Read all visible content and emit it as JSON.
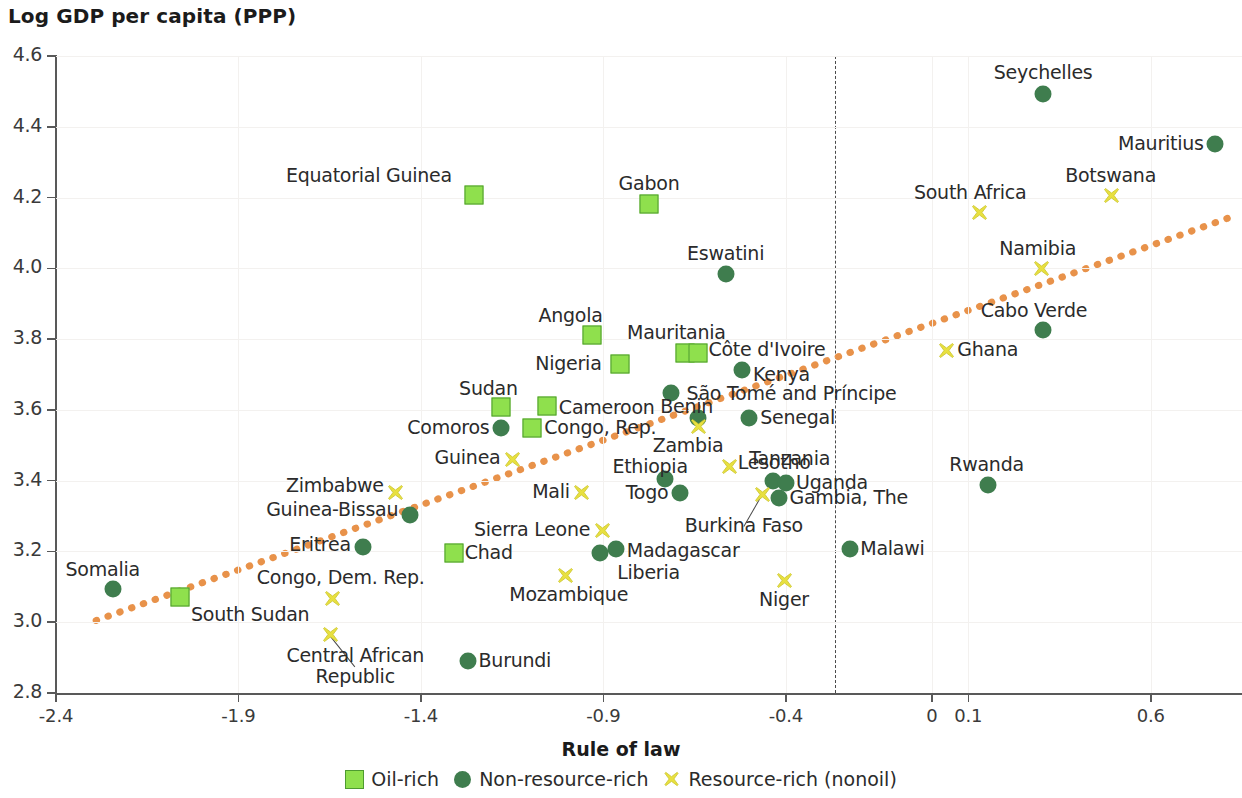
{
  "chart_data": {
    "type": "scatter",
    "title": "Log GDP per capita (PPP)",
    "ylabel": "Log GDP per capita (PPP)",
    "xlabel": "Rule of law",
    "xlim": [
      -2.4,
      0.85
    ],
    "ylim": [
      2.8,
      4.6
    ],
    "xticks": [
      "-2.4",
      "-1.9",
      "-1.4",
      "-0.9",
      "-0.4",
      "0",
      "0.1",
      "0.6"
    ],
    "xtick_values": [
      -2.4,
      -1.9,
      -1.4,
      -0.9,
      -0.4,
      0,
      0.1,
      0.6
    ],
    "yticks": [
      "4.6",
      "4.4",
      "4.2",
      "4.0",
      "3.8",
      "3.6",
      "3.4",
      "3.2",
      "3.0",
      "2.8"
    ],
    "ytick_values": [
      4.6,
      4.4,
      4.2,
      4.0,
      3.8,
      3.6,
      3.4,
      3.2,
      3.0,
      2.8
    ],
    "grid": true,
    "legend_position": "bottom",
    "reference_line": {
      "type": "vertical",
      "x": 0,
      "style": "dashed"
    },
    "trendline": {
      "style": "dotted",
      "color": "#e8924a",
      "x0": -2.29,
      "y0": 3.005,
      "x1": 0.82,
      "y1": 4.145
    },
    "colors": {
      "oil_rich": "#8FE04D",
      "oil_rich_border": "#4E9B30",
      "non_resource_rich": "#3F7D4E",
      "resource_rich": "#E8E040",
      "trend": "#E8924A",
      "axis": "#595959",
      "grid": "#F3F1EF"
    },
    "legend": [
      {
        "label": "Oil-rich",
        "marker": "square",
        "color": "#8FE04D"
      },
      {
        "label": "Non-resource-rich",
        "marker": "circle",
        "color": "#3F7D4E"
      },
      {
        "label": "Resource-rich (nonoil)",
        "marker": "cross",
        "color": "#E8E040"
      }
    ],
    "series": [
      {
        "name": "Oil-rich",
        "marker": "square",
        "points": [
          {
            "label": "Equatorial Guinea",
            "x": -1.255,
            "y": 4.208,
            "lx": -1.315,
            "ly": 4.262,
            "lpos": "left"
          },
          {
            "label": "Gabon",
            "x": -0.775,
            "y": 4.182,
            "lx": -0.775,
            "ly": 4.238,
            "lpos": "center"
          },
          {
            "label": "Angola",
            "x": -0.93,
            "y": 3.812,
            "lx": -0.99,
            "ly": 3.866,
            "lpos": "center"
          },
          {
            "label": "Nigeria",
            "x": -0.855,
            "y": 3.73,
            "lx": -0.905,
            "ly": 3.73,
            "lpos": "left"
          },
          {
            "label": "Mauritania",
            "x": -0.675,
            "y": 3.762,
            "lx": -0.7,
            "ly": 3.818,
            "lpos": "center"
          },
          {
            "label": "Côte d'Ivoire",
            "x": -0.64,
            "y": 3.762,
            "lx": -0.612,
            "ly": 3.77,
            "lpos": "right"
          },
          {
            "label": "Sudan",
            "x": -1.18,
            "y": 3.608,
            "lx": -1.215,
            "ly": 3.66,
            "lpos": "center"
          },
          {
            "label": "Cameroon",
            "x": -1.055,
            "y": 3.61,
            "lx": -1.022,
            "ly": 3.604,
            "lpos": "right"
          },
          {
            "label": "Congo, Rep.",
            "x": -1.095,
            "y": 3.548,
            "lx": -1.062,
            "ly": 3.548,
            "lpos": "right"
          },
          {
            "label": "Chad",
            "x": -1.31,
            "y": 3.196,
            "lx": -1.28,
            "ly": 3.196,
            "lpos": "right"
          },
          {
            "label": "South Sudan",
            "x": -2.06,
            "y": 3.072,
            "lx": -2.03,
            "ly": 3.02,
            "lpos": "right"
          }
        ]
      },
      {
        "name": "Non-resource-rich",
        "marker": "circle",
        "points": [
          {
            "label": "Seychelles",
            "x": 0.305,
            "y": 4.492,
            "lx": 0.305,
            "ly": 4.552,
            "lpos": "center"
          },
          {
            "label": "Mauritius",
            "x": 0.775,
            "y": 4.352,
            "lx": 0.745,
            "ly": 4.352,
            "lpos": "left"
          },
          {
            "label": "Eswatini",
            "x": -0.565,
            "y": 3.985,
            "lx": -0.565,
            "ly": 4.04,
            "lpos": "center"
          },
          {
            "label": "Cabo Verde",
            "x": 0.305,
            "y": 3.825,
            "lx": 0.28,
            "ly": 3.88,
            "lpos": "center"
          },
          {
            "label": "Kenya",
            "x": -0.52,
            "y": 3.712,
            "lx": -0.49,
            "ly": 3.7,
            "lpos": "right"
          },
          {
            "label": "São Tomé and Príncipe",
            "x": -0.715,
            "y": 3.648,
            "lx": -0.672,
            "ly": 3.644,
            "lpos": "right"
          },
          {
            "label": "Benin",
            "x": -0.64,
            "y": 3.578,
            "lx": -0.672,
            "ly": 3.608,
            "lpos": "center"
          },
          {
            "label": "Senegal",
            "x": -0.5,
            "y": 3.578,
            "lx": -0.47,
            "ly": 3.576,
            "lpos": "right"
          },
          {
            "label": "Comoros",
            "x": -1.18,
            "y": 3.548,
            "lx": -1.212,
            "ly": 3.55,
            "lpos": "left"
          },
          {
            "label": "Ethiopia",
            "x": -0.73,
            "y": 3.405,
            "lx": -0.772,
            "ly": 3.44,
            "lpos": "center"
          },
          {
            "label": "Lesotho",
            "x": -0.435,
            "y": 3.4,
            "lx": -0.432,
            "ly": 3.45,
            "lpos": "center"
          },
          {
            "label": "Uganda",
            "x": -0.4,
            "y": 3.394,
            "lx": -0.372,
            "ly": 3.392,
            "lpos": "right"
          },
          {
            "label": "Gambia, The",
            "x": -0.42,
            "y": 3.352,
            "lx": -0.39,
            "ly": 3.35,
            "lpos": "right"
          },
          {
            "label": "Togo",
            "x": -0.69,
            "y": 3.365,
            "lx": -0.722,
            "ly": 3.366,
            "lpos": "left"
          },
          {
            "label": "Rwanda",
            "x": 0.155,
            "y": 3.388,
            "lx": 0.15,
            "ly": 3.444,
            "lpos": "center"
          },
          {
            "label": "Guinea-Bissau",
            "x": -1.43,
            "y": 3.302,
            "lx": -1.462,
            "ly": 3.318,
            "lpos": "left"
          },
          {
            "label": "Eritrea",
            "x": -1.56,
            "y": 3.212,
            "lx": -1.592,
            "ly": 3.218,
            "lpos": "left"
          },
          {
            "label": "Malawi",
            "x": -0.225,
            "y": 3.208,
            "lx": -0.196,
            "ly": 3.208,
            "lpos": "right"
          },
          {
            "label": "Madagascar",
            "x": -0.865,
            "y": 3.208,
            "lx": -0.836,
            "ly": 3.202,
            "lpos": "right"
          },
          {
            "label": "Liberia",
            "x": -0.91,
            "y": 3.196,
            "lx": -0.862,
            "ly": 3.14,
            "lpos": "right"
          },
          {
            "label": "Somalia",
            "x": -2.245,
            "y": 3.094,
            "lx": -2.272,
            "ly": 3.148,
            "lpos": "center"
          },
          {
            "label": "Burundi",
            "x": -1.27,
            "y": 2.89,
            "lx": -1.242,
            "ly": 2.89,
            "lpos": "right"
          }
        ]
      },
      {
        "name": "Resource-rich (nonoil)",
        "marker": "cross",
        "points": [
          {
            "label": "Botswana",
            "x": 0.49,
            "y": 4.208,
            "lx": 0.49,
            "ly": 4.262,
            "lpos": "center"
          },
          {
            "label": "South Africa",
            "x": 0.13,
            "y": 4.16,
            "lx": 0.105,
            "ly": 4.212,
            "lpos": "center"
          },
          {
            "label": "Namibia",
            "x": 0.3,
            "y": 4.0,
            "lx": 0.29,
            "ly": 4.054,
            "lpos": "center"
          },
          {
            "label": "Ghana",
            "x": 0.04,
            "y": 3.77,
            "lx": 0.07,
            "ly": 3.768,
            "lpos": "right"
          },
          {
            "label": "Zambia",
            "x": -0.64,
            "y": 3.555,
            "lx": -0.668,
            "ly": 3.498,
            "lpos": "center"
          },
          {
            "label": "Tanzania",
            "x": -0.555,
            "y": 3.442,
            "lx": -0.5,
            "ly": 3.462,
            "lpos": "right"
          },
          {
            "label": "Guinea",
            "x": -1.15,
            "y": 3.462,
            "lx": -1.182,
            "ly": 3.464,
            "lpos": "left"
          },
          {
            "label": "Zimbabwe",
            "x": -1.47,
            "y": 3.368,
            "lx": -1.502,
            "ly": 3.384,
            "lpos": "left"
          },
          {
            "label": "Mali",
            "x": -0.96,
            "y": 3.368,
            "lx": -0.992,
            "ly": 3.368,
            "lpos": "left"
          },
          {
            "label": "Burkina Faso",
            "x": -0.465,
            "y": 3.362,
            "lx": -0.515,
            "ly": 3.272,
            "lpos": "center"
          },
          {
            "label": "Sierra Leone",
            "x": -0.905,
            "y": 3.26,
            "lx": -0.936,
            "ly": 3.26,
            "lpos": "left"
          },
          {
            "label": "Congo, Dem. Rep.",
            "x": -1.645,
            "y": 3.068,
            "lx": -1.62,
            "ly": 3.124,
            "lpos": "center"
          },
          {
            "label": "Mozambique",
            "x": -1.005,
            "y": 3.134,
            "lx": -0.995,
            "ly": 3.078,
            "lpos": "center"
          },
          {
            "label": "Niger",
            "x": -0.405,
            "y": 3.118,
            "lx": -0.405,
            "ly": 3.062,
            "lpos": "center"
          },
          {
            "label": "Central African Republic",
            "x": -1.65,
            "y": 2.966,
            "lx": -1.58,
            "ly": 2.876,
            "lpos": "center"
          }
        ]
      }
    ]
  }
}
